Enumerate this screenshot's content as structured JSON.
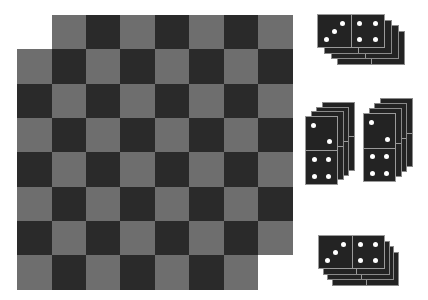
{
  "colors": {
    "background": "#ffffff",
    "dark_square": "#2a2a2a",
    "light_square": "#6e6e6e",
    "domino_body": "#232323",
    "domino_edge": "#9a9a9a",
    "pip": "#ffffff"
  },
  "board": {
    "origin_x": 17.3,
    "origin_y": 14.7,
    "cell_size": 34.4,
    "rows": 8,
    "cols": 8,
    "dark_when_row_plus_col_even": true,
    "missing_cells": [
      {
        "row": 0,
        "col": 0
      },
      {
        "row": 7,
        "col": 7
      }
    ]
  },
  "domino_stacks": [
    {
      "name": "stack-top",
      "orientation": "horizontal",
      "count": 4,
      "front": {
        "x": 317,
        "y": 14,
        "w": 68,
        "h": 34
      },
      "step": {
        "dx": 6.8,
        "dy": 5.5
      },
      "values": [
        3,
        4
      ]
    },
    {
      "name": "stack-middle-left",
      "orientation": "vertical",
      "count": 4,
      "front": {
        "x": 305,
        "y": 115.7,
        "w": 33,
        "h": 69
      },
      "step": {
        "dx": 5.7,
        "dy": -4.6
      },
      "values": [
        2,
        4
      ]
    },
    {
      "name": "stack-middle-right",
      "orientation": "vertical",
      "count": 4,
      "front": {
        "x": 363,
        "y": 113.3,
        "w": 33,
        "h": 69
      },
      "step": {
        "dx": 5.5,
        "dy": -5
      },
      "values": [
        2,
        4
      ]
    },
    {
      "name": "stack-bottom",
      "orientation": "horizontal",
      "count": 4,
      "front": {
        "x": 318,
        "y": 235,
        "w": 67,
        "h": 34
      },
      "step": {
        "dx": 4.7,
        "dy": 5.6
      },
      "values": [
        3,
        4
      ]
    }
  ]
}
